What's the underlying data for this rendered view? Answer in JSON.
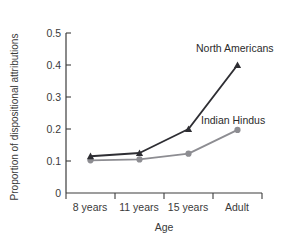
{
  "chart_data": {
    "type": "line",
    "title": "",
    "xlabel": "Age",
    "ylabel": "Proportion of dispositional attributions",
    "categories": [
      "8 years",
      "11 years",
      "15 years",
      "Adult"
    ],
    "ylim": [
      0,
      0.5
    ],
    "yticks": [
      "0",
      "0.1",
      "0.2",
      "0.3",
      "0.4",
      "0.5"
    ],
    "ytick_values": [
      0,
      0.1,
      0.2,
      0.3,
      0.4,
      0.5
    ],
    "grid": false,
    "legend_position": "inline-annotation",
    "series": [
      {
        "name": "North Americans",
        "values": [
          0.115,
          0.125,
          0.2,
          0.4
        ],
        "color": "#2e2e33",
        "marker": "triangle"
      },
      {
        "name": "Indian Hindus",
        "values": [
          0.102,
          0.105,
          0.123,
          0.197
        ],
        "color": "#8d8d92",
        "marker": "circle"
      }
    ],
    "annotations": [
      {
        "text": "North Americans",
        "series": "North Americans"
      },
      {
        "text": "Indian Hindus",
        "series": "Indian Hindus"
      }
    ]
  }
}
